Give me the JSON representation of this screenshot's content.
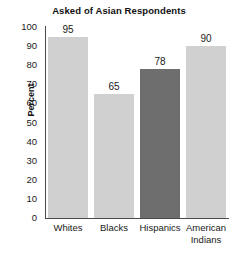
{
  "chart_data": {
    "type": "bar",
    "title": "Asked of Asian Respondents",
    "xlabel": "",
    "ylabel": "Percent",
    "categories": [
      "Whites",
      "Blacks",
      "Hispanics",
      "American Indians"
    ],
    "category_lines": [
      [
        "Whites"
      ],
      [
        "Blacks"
      ],
      [
        "Hispanics"
      ],
      [
        "American",
        "Indians"
      ]
    ],
    "values": [
      95,
      65,
      78,
      90
    ],
    "value_labels": [
      "95",
      "65",
      "78",
      "90"
    ],
    "ylim": [
      0,
      100
    ],
    "ytick_step": 10,
    "yticks": [
      "100",
      "90",
      "80",
      "70",
      "60",
      "50",
      "40",
      "30",
      "20",
      "10",
      "0"
    ],
    "grid": false,
    "legend": "none",
    "highlight_index": 2,
    "colors": {
      "bar": "#d0d0d0",
      "bar_highlight": "#6e6e6e",
      "axis": "#4a4a4a",
      "text": "#1a1a1a",
      "background": "#ffffff"
    }
  }
}
